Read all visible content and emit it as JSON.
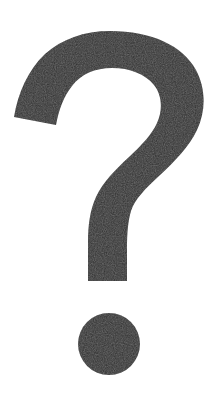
{
  "image": {
    "kind": "symbol-illustration",
    "subject_icon_name": "question-mark-icon",
    "character": "?",
    "alt_text": "?",
    "width": 222,
    "height": 395,
    "background_color": "#ffffff",
    "glyph_color": "#2f2f2f",
    "texture": "grainy-scanned"
  },
  "glyph_geometry": {
    "bowl": {
      "top_y": 33,
      "left_x": 13,
      "right_x": 205,
      "left_terminal_bottom_y": 127
    },
    "counter": {
      "shape": "teardrop",
      "left_x": 60,
      "right_x": 167,
      "top_y": 75,
      "bottom_y": 190
    },
    "stem": {
      "left_x": 86,
      "right_x": 135,
      "bottom_y": 281
    },
    "dot": {
      "center_x": 109,
      "center_y": 344,
      "radius": 31
    }
  }
}
